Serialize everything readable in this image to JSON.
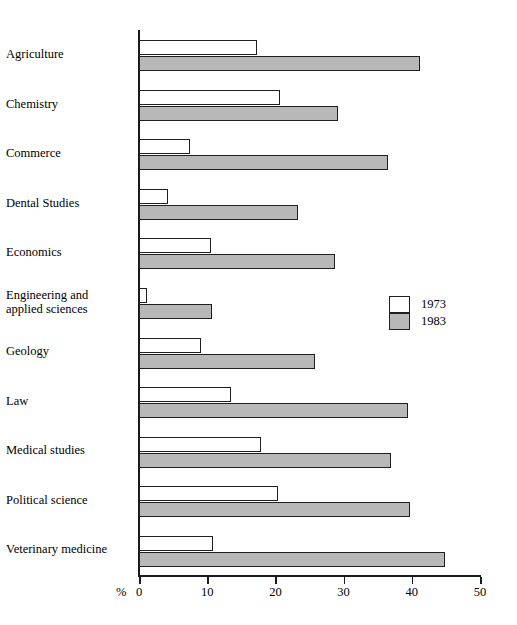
{
  "chart_data": {
    "type": "bar",
    "orientation": "horizontal",
    "title": "",
    "subtitle": "",
    "xlabel": "%",
    "ylabel": "",
    "xlim": [
      0,
      50
    ],
    "xticks": [
      "0",
      "10",
      "20",
      "30",
      "40",
      "50"
    ],
    "xtick_values": [
      0,
      10,
      20,
      30,
      40,
      50
    ],
    "grid": false,
    "legend_position": "right-middle",
    "categories": [
      "Agriculture",
      "Chemistry",
      "Commerce",
      "Dental Studies",
      "Economics",
      "Engineering and\napplied sciences",
      "Geology",
      "Law",
      "Medical studies",
      "Political science",
      "Veterinary medicine"
    ],
    "series": [
      {
        "name": "1973",
        "color": "#ffffff",
        "values": [
          17.3,
          20.7,
          7.5,
          4.3,
          10.6,
          1.2,
          9.1,
          13.5,
          17.9,
          20.4,
          10.9
        ]
      },
      {
        "name": "1983",
        "color": "#b8b8b8",
        "values": [
          41.2,
          29.2,
          36.5,
          23.3,
          28.7,
          10.7,
          25.8,
          39.4,
          37.0,
          39.7,
          44.9
        ]
      }
    ],
    "legend": [
      "1973",
      "1983"
    ]
  },
  "legend": {
    "items": [
      {
        "label": "1973",
        "swatch": "white-swatch"
      },
      {
        "label": "1983",
        "swatch": "gray-swatch"
      }
    ]
  },
  "axis": {
    "percent_symbol": "%"
  }
}
